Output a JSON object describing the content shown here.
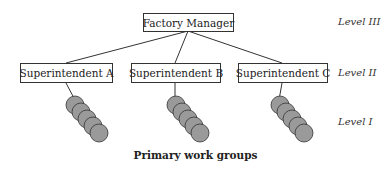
{
  "diagram": {
    "top": {
      "label": "Factory Manager"
    },
    "middle": [
      {
        "label": "Superintendent A"
      },
      {
        "label": "Superintendent B"
      },
      {
        "label": "Superintendent C"
      }
    ],
    "levels": [
      "Level III",
      "Level II",
      "Level I"
    ],
    "caption": "Primary work groups",
    "colors": {
      "circle_fill": "#9a9a9a",
      "stroke": "#333333"
    }
  }
}
